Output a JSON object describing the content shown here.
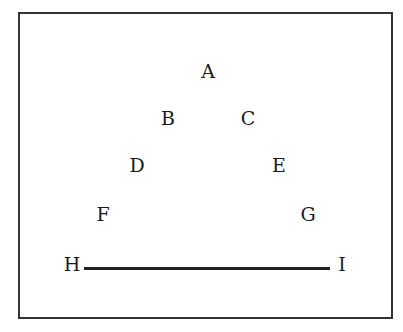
{
  "diagram": {
    "type": "letter-arrangement",
    "nodes": [
      {
        "id": "A",
        "label": "A",
        "x": 208,
        "y": 71
      },
      {
        "id": "B",
        "label": "B",
        "x": 168,
        "y": 118
      },
      {
        "id": "C",
        "label": "C",
        "x": 248,
        "y": 118
      },
      {
        "id": "D",
        "label": "D",
        "x": 137,
        "y": 165
      },
      {
        "id": "E",
        "label": "E",
        "x": 279,
        "y": 165
      },
      {
        "id": "F",
        "label": "F",
        "x": 103,
        "y": 214
      },
      {
        "id": "G",
        "label": "G",
        "x": 308,
        "y": 214
      },
      {
        "id": "H",
        "label": "H",
        "x": 72,
        "y": 264
      },
      {
        "id": "I",
        "label": "I",
        "x": 342,
        "y": 264
      }
    ],
    "edges": [
      {
        "from": "H",
        "to": "I",
        "style": "solid-thick"
      }
    ],
    "colors": {
      "border": "#333333",
      "text": "#1a1a1a",
      "line": "#222222",
      "background": "#ffffff"
    }
  }
}
